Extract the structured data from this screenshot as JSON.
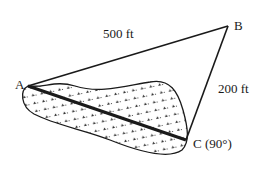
{
  "diagram": {
    "type": "geometry-word-problem",
    "points": {
      "A": {
        "label": "A"
      },
      "B": {
        "label": "B"
      },
      "C": {
        "label": "C (90°)"
      }
    },
    "edges": [
      {
        "from": "A",
        "to": "B",
        "label": "500 ft"
      },
      {
        "from": "B",
        "to": "C",
        "label": "200 ft"
      },
      {
        "from": "A",
        "to": "C",
        "label": "",
        "note": "unknown distance across lake"
      }
    ],
    "right_angle_at": "C",
    "region": {
      "name": "lake",
      "fill": "dotted pattern"
    },
    "colors": {
      "stroke": "#1a1a1a",
      "background": "#ffffff"
    }
  }
}
